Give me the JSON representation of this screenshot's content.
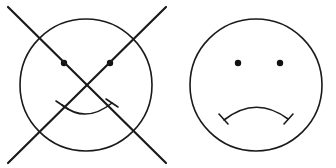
{
  "figure": {
    "background_color": "#ffffff",
    "ink_color": "#1a1a1a",
    "width": 336,
    "height": 168,
    "panel_count": 2
  },
  "panels": [
    {
      "id": "left-panel",
      "name": "crossed-out-smiley-face",
      "description": "Smiling face circle struck through with a large X",
      "struck_out": true,
      "face": {
        "expression": "smile",
        "outline": {
          "cx": 86,
          "cy": 85,
          "r": 66,
          "stroke_width": 1.6
        },
        "eyes": [
          {
            "name": "left-eye",
            "cx": 64,
            "cy": 63,
            "r": 3.2
          },
          {
            "name": "right-eye",
            "cx": 110,
            "cy": 63,
            "r": 3.2
          }
        ],
        "mouth": {
          "type": "smile-arc",
          "path": "M 62 105 Q 86 124 112 103",
          "ticks": [
            {
              "name": "mouth-tick-left",
              "path": "M 56 101 L 68 109"
            },
            {
              "name": "mouth-tick-right",
              "path": "M 106 99 L 118 107"
            }
          ]
        }
      },
      "cross": {
        "name": "strike-through-x",
        "strokes": [
          {
            "name": "cross-stroke-down",
            "x1": 8,
            "y1": 7,
            "x2": 166,
            "y2": 163
          },
          {
            "name": "cross-stroke-up",
            "x1": 8,
            "y1": 163,
            "x2": 166,
            "y2": 7
          }
        ],
        "stroke_width": 2.2
      }
    },
    {
      "id": "right-panel",
      "name": "frowning-face",
      "description": "Frowning face circle, not struck out",
      "struck_out": false,
      "face": {
        "expression": "frown",
        "outline": {
          "cx": 256,
          "cy": 85,
          "r": 66,
          "stroke_width": 1.6
        },
        "eyes": [
          {
            "name": "left-eye",
            "cx": 238,
            "cy": 63,
            "r": 3.2
          },
          {
            "name": "right-eye",
            "cx": 280,
            "cy": 63,
            "r": 3.2
          }
        ],
        "mouth": {
          "type": "frown-arc",
          "path": "M 224 120 Q 256 95 288 119",
          "ticks": [
            {
              "name": "mouth-tick-left",
              "path": "M 219 114 L 228 124"
            },
            {
              "name": "mouth-tick-right",
              "path": "M 284 124 L 293 114"
            }
          ]
        }
      }
    }
  ],
  "legend": {
    "left_label": "",
    "right_label": ""
  }
}
